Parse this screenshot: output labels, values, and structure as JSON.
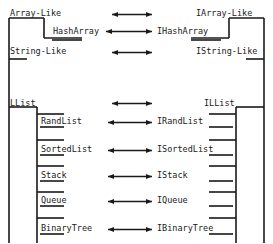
{
  "diagram": {
    "type": "class-interface-correspondence-diagram",
    "title": "",
    "background_color": "#ffffff",
    "line_color": "#1a1a1a",
    "arrow_style": "double-headed",
    "left_column_header": "",
    "right_column_header": "",
    "rows": [
      {
        "id": "array-like",
        "class_label": "Array-Like",
        "interface_label": "IArray-Like",
        "has_arrow": true,
        "depth": 0,
        "y": 13
      },
      {
        "id": "hasharray",
        "class_label": "HashArray",
        "interface_label": "IHashArray",
        "has_arrow": true,
        "depth": 1,
        "y": 30
      },
      {
        "id": "string-like",
        "class_label": "String-Like",
        "interface_label": "IString-Like",
        "has_arrow": true,
        "depth": 0,
        "y": 51
      },
      {
        "id": "llist",
        "class_label": "LList",
        "interface_label": "ILList",
        "has_arrow": true,
        "depth": 0,
        "y": 102
      },
      {
        "id": "randlist",
        "class_label": "RandList",
        "interface_label": "IRandList",
        "has_arrow": true,
        "depth": 1,
        "y": 120
      },
      {
        "id": "sortedlist",
        "class_label": "SortedList",
        "interface_label": "ISortedList",
        "has_arrow": true,
        "depth": 1,
        "y": 148
      },
      {
        "id": "stack",
        "class_label": "Stack",
        "interface_label": "IStack",
        "has_arrow": true,
        "depth": 1,
        "y": 174
      },
      {
        "id": "queue",
        "class_label": "Queue",
        "interface_label": "IQueue",
        "has_arrow": true,
        "depth": 1,
        "y": 199
      },
      {
        "id": "binarytree",
        "class_label": "BinaryTree",
        "interface_label": "IBinaryTree",
        "has_arrow": true,
        "depth": 1,
        "y": 227
      }
    ]
  }
}
